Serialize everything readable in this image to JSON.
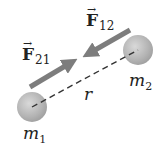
{
  "diagram": {
    "type": "gravitational-force-pair",
    "colors": {
      "background": "#ffffff",
      "sphere": "#b5b5b5",
      "sphere_highlight": "#d6d6d6",
      "arrow": "#7d7d7d",
      "dashed_line": "#333333",
      "text": "#222222"
    },
    "bodies": [
      {
        "id": "m1",
        "label_base": "m",
        "label_sub": "1",
        "cx": 32,
        "cy": 107,
        "r": 15
      },
      {
        "id": "m2",
        "label_base": "m",
        "label_sub": "2",
        "cx": 138,
        "cy": 50,
        "r": 15
      }
    ],
    "forces": [
      {
        "id": "F21",
        "label_base": "F",
        "label_sub": "21",
        "arrow_glyph": "→",
        "from": [
          30,
          87
        ],
        "to": [
          76,
          60
        ]
      },
      {
        "id": "F12",
        "label_base": "F",
        "label_sub": "12",
        "arrow_glyph": "→",
        "from": [
          130,
          30
        ],
        "to": [
          84,
          56
        ]
      }
    ],
    "separation": {
      "label": "r"
    }
  }
}
